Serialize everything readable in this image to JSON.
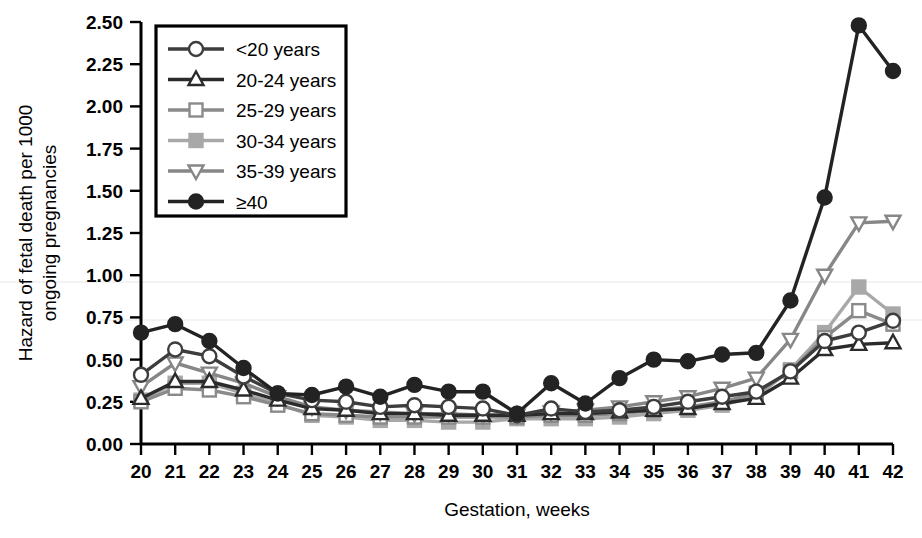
{
  "chart_data": {
    "type": "line",
    "title": "",
    "xlabel": "Gestation, weeks",
    "ylabel": "Hazard of fetal death per 1000 ongoing pregnancies",
    "x": [
      20,
      21,
      22,
      23,
      24,
      25,
      26,
      27,
      28,
      29,
      30,
      31,
      32,
      33,
      34,
      35,
      36,
      37,
      38,
      39,
      40,
      41,
      42
    ],
    "xtick_labels": [
      "20",
      "21",
      "22",
      "23",
      "24",
      "25",
      "26",
      "27",
      "28",
      "29",
      "30",
      "31",
      "32",
      "33",
      "34",
      "35",
      "36",
      "37",
      "38",
      "39",
      "40",
      "41",
      "42"
    ],
    "ytick_labels": [
      "0.00",
      "0.25",
      "0.50",
      "0.75",
      "1.00",
      "1.25",
      "1.50",
      "1.75",
      "2.00",
      "2.25",
      "2.50"
    ],
    "ytick_values": [
      0,
      0.25,
      0.5,
      0.75,
      1.0,
      1.25,
      1.5,
      1.75,
      2.0,
      2.25,
      2.5
    ],
    "xlim": [
      20,
      42
    ],
    "ylim": [
      0,
      2.5
    ],
    "grid": false,
    "legend_position": "top-left-inside",
    "series": [
      {
        "name": "<20 years",
        "marker": "open-circle",
        "color": "#3d3d3d",
        "marker_fill": "#ffffff",
        "values": [
          0.41,
          0.56,
          0.52,
          0.4,
          0.3,
          0.26,
          0.25,
          0.22,
          0.23,
          0.22,
          0.21,
          0.17,
          0.21,
          0.19,
          0.2,
          0.22,
          0.25,
          0.28,
          0.31,
          0.43,
          0.61,
          0.66,
          0.73
        ]
      },
      {
        "name": "20-24 years",
        "marker": "open-triangle-up",
        "color": "#2b2b2b",
        "marker_fill": "#ffffff",
        "values": [
          0.27,
          0.37,
          0.37,
          0.32,
          0.26,
          0.21,
          0.2,
          0.18,
          0.18,
          0.17,
          0.17,
          0.17,
          0.18,
          0.18,
          0.19,
          0.2,
          0.21,
          0.24,
          0.27,
          0.39,
          0.56,
          0.59,
          0.6
        ]
      },
      {
        "name": "25-29 years",
        "marker": "open-square",
        "color": "#8a8a8a",
        "marker_fill": "#ffffff",
        "values": [
          0.25,
          0.33,
          0.32,
          0.28,
          0.23,
          0.18,
          0.17,
          0.16,
          0.16,
          0.16,
          0.16,
          0.16,
          0.17,
          0.17,
          0.18,
          0.2,
          0.22,
          0.25,
          0.3,
          0.43,
          0.63,
          0.79,
          0.71
        ]
      },
      {
        "name": "30-34 years",
        "marker": "filled-square",
        "color": "#a8a8a8",
        "marker_fill": "#a8a8a8",
        "values": [
          0.26,
          0.36,
          0.36,
          0.3,
          0.24,
          0.17,
          0.16,
          0.14,
          0.14,
          0.13,
          0.13,
          0.15,
          0.15,
          0.15,
          0.16,
          0.18,
          0.2,
          0.23,
          0.28,
          0.44,
          0.66,
          0.93,
          0.77
        ]
      },
      {
        "name": "35-39 years",
        "marker": "open-triangle-down",
        "color": "#878787",
        "marker_fill": "#ffffff",
        "values": [
          0.34,
          0.48,
          0.42,
          0.36,
          0.28,
          0.22,
          0.2,
          0.19,
          0.18,
          0.18,
          0.17,
          0.17,
          0.19,
          0.2,
          0.22,
          0.25,
          0.28,
          0.33,
          0.39,
          0.62,
          1.0,
          1.31,
          1.32
        ]
      },
      {
        "name": "≥40",
        "marker": "filled-circle",
        "color": "#232323",
        "marker_fill": "#232323",
        "values": [
          0.66,
          0.71,
          0.61,
          0.45,
          0.3,
          0.29,
          0.34,
          0.28,
          0.35,
          0.31,
          0.31,
          0.18,
          0.36,
          0.24,
          0.39,
          0.5,
          0.49,
          0.53,
          0.54,
          0.85,
          1.46,
          2.48,
          2.21
        ]
      }
    ]
  },
  "legend": {
    "entries": [
      {
        "label": "<20 years"
      },
      {
        "label": "20-24 years"
      },
      {
        "label": "25-29 years"
      },
      {
        "label": "30-34 years"
      },
      {
        "label": "35-39 years"
      },
      {
        "label": "≥40"
      }
    ]
  }
}
